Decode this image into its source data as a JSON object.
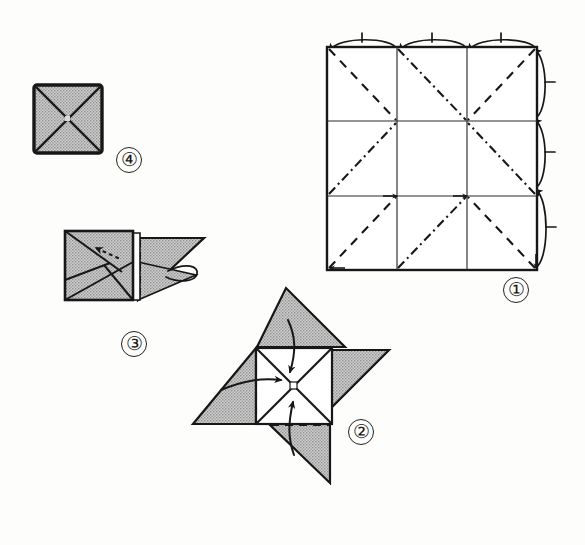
{
  "document": {
    "type": "origami-instruction-diagram",
    "title": "Origami folding sequence",
    "background_color": "#fdfdfc",
    "ink_color": "#1a1a1a",
    "paper_gray": "#b9b9b9",
    "paper_white": "#ffffff",
    "width": 585,
    "height": 545
  },
  "steps": [
    {
      "id": "step-1",
      "label": "①",
      "number": 1,
      "name": "grid-creased-square",
      "description": "Square sheet creased into a 3 by 3 grid with diagonal valley and mountain folds, curved arrows folding the top edge and the right edge inward.",
      "square": {
        "x": 327,
        "y": 47,
        "size": 210
      },
      "grid_divisions": 3,
      "fold_lines": {
        "solid_grid": 4,
        "dashed_diagonals": 4,
        "dash_dot_diagonals": 4
      },
      "arrows": {
        "top_arcs": 3,
        "right_arcs": 3,
        "direction_top": "left",
        "direction_right": "up"
      }
    },
    {
      "id": "step-2",
      "label": "②",
      "number": 2,
      "name": "pinwheel-open-flaps",
      "description": "Pinwheel shape: central square with an X crease and four shaded triangular flaps radiating outward; three curved arrows fold the flaps inward toward the center.",
      "center": {
        "x": 292,
        "y": 385
      },
      "flap_count": 4,
      "arrow_count": 3,
      "arrow_directions": [
        "down",
        "right",
        "up"
      ],
      "dashed_fold_lines": 3
    },
    {
      "id": "step-3",
      "label": "③",
      "number": 3,
      "name": "square-with-side-flap",
      "description": "Shaded square with diagonal creases on the left, a triangular flap extending to the right with a dashed fold line, a dotted arrow pointing into the square and a small looping tuck arrow.",
      "square": {
        "x": 65,
        "y": 231,
        "size": 68
      },
      "dotted_arrow_direction": "upper-left",
      "loop_arrow": true,
      "dashed_fold_lines": 1
    },
    {
      "id": "step-4",
      "label": "④",
      "number": 4,
      "name": "finished-square-with-x",
      "description": "Finished shaded square with a bold outline and an X formed by both diagonals meeting at the center.",
      "square": {
        "x": 34,
        "y": 85,
        "size": 68
      },
      "diagonals": 2
    }
  ],
  "legend": {
    "dashed_line": "valley fold",
    "dash_dot_line": "mountain fold",
    "dotted_arrow": "hidden / tuck movement",
    "curved_arrow": "fold direction"
  }
}
